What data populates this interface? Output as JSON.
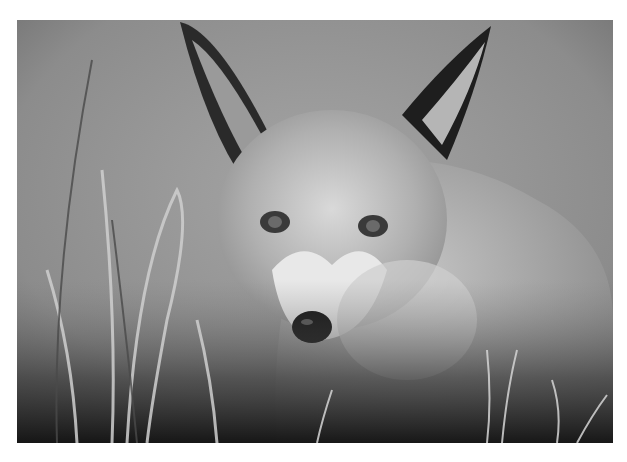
{
  "image": {
    "subject": "red fox close-up",
    "style": "black and white photograph",
    "colors": {
      "background": "#ffffff",
      "mid_gray": "#8a8a8a",
      "dark": "#1a1a1a",
      "light": "#e6e6e6"
    }
  }
}
